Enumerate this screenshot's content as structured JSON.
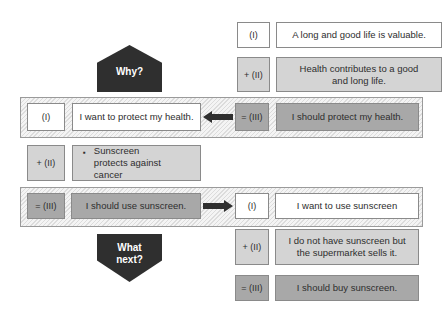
{
  "top": {
    "row1": {
      "label": "(I)",
      "text": "A long and good life is valuable."
    },
    "row2": {
      "label": "+ (II)",
      "text": "Health contributes to a good and long life."
    }
  },
  "why_shape": {
    "text": "Why?"
  },
  "band1": {
    "left_label": "(I)",
    "left_text": "I want to protect my health.",
    "arrow_direction": "left",
    "right_label": "= (III)",
    "right_text": "I should protect my health."
  },
  "middle": {
    "label": "+ (II)",
    "bullet": "▪",
    "text": "Sunscreen protects against cancer"
  },
  "band2": {
    "left_label": "= (III)",
    "left_text": "I should use sunscreen.",
    "arrow_direction": "right",
    "right_label": "(I)",
    "right_text": "I want to use sunscreen"
  },
  "next_shape": {
    "text": "What next?"
  },
  "bottom": {
    "row1": {
      "label": "+ (II)",
      "text": "I do not have sunscreen but the supermarket sells it."
    },
    "row2": {
      "label": "= (III)",
      "text": "I should buy sunscreen."
    }
  },
  "colors": {
    "white_box": "#ffffff",
    "premise_box": "#d4d4d4",
    "conclusion_box": "#a8a8a8",
    "shape_fill": "#2f2f2f"
  }
}
